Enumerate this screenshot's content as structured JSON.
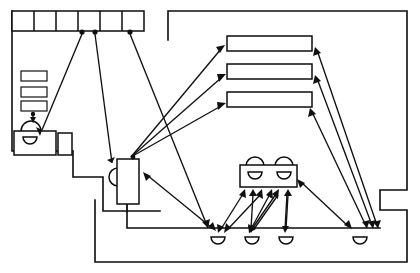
{
  "diagram": {
    "title": "Floor plan with movement-flow arrows",
    "kind": "architectural-floorplan",
    "canvas": {
      "width": 420,
      "height": 273,
      "background": "#ffffff"
    },
    "stroke_color": "#0d0d0d",
    "arrow_color": "#101010"
  },
  "rooms": [
    {
      "name": "left-room",
      "label": "Left room",
      "outline": "M 12,11 L 12,151 L 73,151 L 73,177 L 103,177 L 103,211 L 160,211"
    },
    {
      "name": "right-room",
      "label": "Right room",
      "outline": "M 168,11 L 168,40"
    }
  ],
  "fixtures": {
    "top_cell_strip": {
      "name": "top-cell-strip",
      "label": "Row of six cells",
      "x": 12,
      "y": 11,
      "width": 132,
      "height": 20,
      "cell_count": 6
    },
    "left_small_rects": {
      "name": "left-small-rectangles",
      "label": "Three stacked small rectangles",
      "count": 3,
      "items": [
        {
          "x": 21,
          "y": 71,
          "width": 26,
          "height": 10
        },
        {
          "x": 21,
          "y": 87,
          "width": 26,
          "height": 10
        },
        {
          "x": 21,
          "y": 101,
          "width": 26,
          "height": 10
        }
      ]
    },
    "left_dome": {
      "name": "left-dome-fixture",
      "label": "Dome fixture above counter",
      "cx": 31,
      "cy": 131,
      "r": 10
    },
    "left_counter": {
      "name": "left-counter",
      "label": "Counter with basin",
      "x": 14,
      "y": 131,
      "width": 42,
      "height": 24
    },
    "left_counter_basin": {
      "name": "left-counter-basin",
      "label": "Basin in left counter",
      "cx": 30,
      "cy": 140,
      "r": 7
    },
    "left_side_box": {
      "name": "left-side-box",
      "label": "Small box beside counter",
      "x": 58,
      "y": 133,
      "width": 14,
      "height": 22
    },
    "mid_unit": {
      "name": "mid-unit",
      "label": "Central tall unit with basin",
      "x": 117,
      "y": 159,
      "width": 22,
      "height": 45
    },
    "mid_unit_basin": {
      "name": "mid-unit-basin",
      "label": "Basin on central unit",
      "cx": 117,
      "cy": 177,
      "r": 9
    },
    "bars": {
      "name": "horizontal-bars",
      "label": "Three horizontal bar fixtures",
      "count": 3,
      "items": [
        {
          "x": 227,
          "y": 36,
          "width": 85,
          "height": 15
        },
        {
          "x": 227,
          "y": 64,
          "width": 85,
          "height": 15
        },
        {
          "x": 227,
          "y": 92,
          "width": 85,
          "height": 15
        }
      ]
    },
    "table_unit": {
      "name": "table-unit",
      "label": "Table with two seats and two basins",
      "x": 240,
      "y": 165,
      "width": 57,
      "height": 22,
      "top_seats": [
        {
          "cx": 255,
          "cy": 165,
          "r": 9
        },
        {
          "cx": 284,
          "cy": 165,
          "r": 9
        }
      ],
      "inner_basins": [
        {
          "cx": 255,
          "cy": 172,
          "r": 7
        },
        {
          "cx": 284,
          "cy": 172,
          "r": 7
        }
      ]
    },
    "bottom_domes": {
      "name": "bottom-dome-row",
      "label": "Row of four basins along lower wall",
      "count": 4,
      "items": [
        {
          "cx": 218,
          "cy": 240,
          "r": 7
        },
        {
          "cx": 252,
          "cy": 240,
          "r": 7
        },
        {
          "cx": 286,
          "cy": 240,
          "r": 7
        },
        {
          "cx": 360,
          "cy": 240,
          "r": 7
        }
      ]
    }
  },
  "arrows": {
    "label": "Movement / sight-line arrows",
    "count": 22,
    "list": [
      {
        "name": "arrow-dome-to-cellstrip",
        "from": [
          42,
          130
        ],
        "to": [
          82,
          32
        ]
      },
      {
        "name": "arrow-midunit-to-cellstrip",
        "from": [
          112,
          163
        ],
        "to": [
          95,
          32
        ]
      },
      {
        "name": "arrow-lowerfloor-to-cellstrip",
        "from": [
          208,
          228
        ],
        "to": [
          130,
          32
        ]
      },
      {
        "name": "arrow-rect-to-dome",
        "from": [
          33,
          112
        ],
        "to": [
          33,
          122
        ]
      },
      {
        "name": "arrow-mid-to-bar1",
        "from": [
          130,
          158
        ],
        "to": [
          222,
          48
        ]
      },
      {
        "name": "arrow-mid-to-bar2",
        "from": [
          130,
          158
        ],
        "to": [
          222,
          76
        ]
      },
      {
        "name": "arrow-mid-to-bar3",
        "from": [
          130,
          158
        ],
        "to": [
          222,
          104
        ]
      },
      {
        "name": "arrow-right-to-bar1",
        "from": [
          375,
          228
        ],
        "to": [
          316,
          50
        ]
      },
      {
        "name": "arrow-right-to-bar2",
        "from": [
          372,
          228
        ],
        "to": [
          316,
          78
        ]
      },
      {
        "name": "arrow-right-to-bar3",
        "from": [
          366,
          228
        ],
        "to": [
          310,
          113
        ]
      },
      {
        "name": "arrow-midunit-to-floor",
        "from": [
          146,
          174
        ],
        "to": [
          214,
          229
        ]
      },
      {
        "name": "arrow-table-to-floor-right",
        "from": [
          302,
          181
        ],
        "to": [
          348,
          228
        ]
      },
      {
        "name": "arrow-floor-to-table-a",
        "from": [
          222,
          231
        ],
        "to": [
          245,
          193
        ]
      },
      {
        "name": "arrow-floor-to-table-b",
        "from": [
          250,
          231
        ],
        "to": [
          254,
          193
        ]
      },
      {
        "name": "arrow-table-to-floor-a",
        "from": [
          258,
          193
        ],
        "to": [
          227,
          231
        ]
      },
      {
        "name": "arrow-table-to-floor-b",
        "from": [
          267,
          193
        ],
        "to": [
          250,
          231
        ]
      },
      {
        "name": "arrow-floor-to-table-c",
        "from": [
          250,
          231
        ],
        "to": [
          277,
          193
        ]
      },
      {
        "name": "arrow-floor-to-table-d",
        "from": [
          284,
          231
        ],
        "to": [
          286,
          193
        ]
      },
      {
        "name": "arrow-table-to-floor-c",
        "from": [
          277,
          193
        ],
        "to": [
          252,
          231
        ]
      },
      {
        "name": "arrow-table-to-floor-d",
        "from": [
          286,
          193
        ],
        "to": [
          284,
          231
        ]
      }
    ]
  }
}
